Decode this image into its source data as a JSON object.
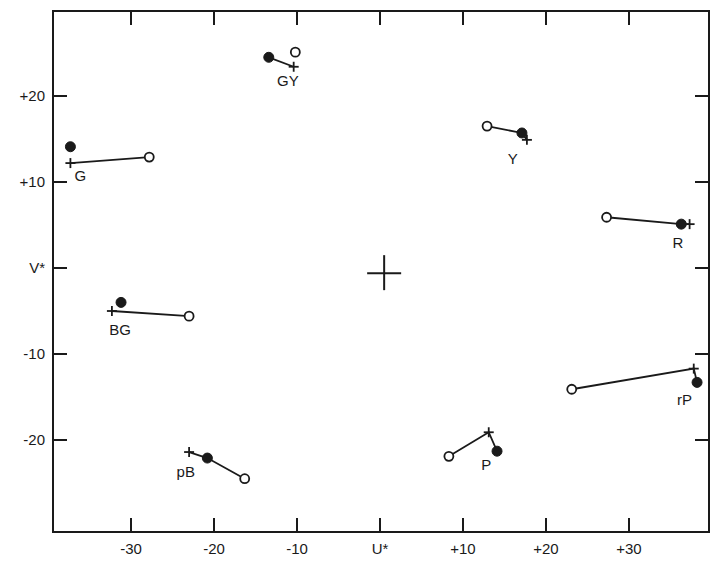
{
  "chart_data": {
    "type": "scatter",
    "title": "",
    "xlabel": "U*",
    "ylabel": "V*",
    "xlim": [
      -39.4,
      39.6
    ],
    "ylim": [
      -30.7,
      29.9
    ],
    "grid": false,
    "legend": null,
    "x_ticks": [
      {
        "value": -30,
        "label": "-30"
      },
      {
        "value": -20,
        "label": "-20"
      },
      {
        "value": -10,
        "label": "-10"
      },
      {
        "value": 0,
        "label": "U*"
      },
      {
        "value": 10,
        "label": "+10"
      },
      {
        "value": 20,
        "label": "+20"
      },
      {
        "value": 30,
        "label": "+30"
      }
    ],
    "y_ticks": [
      {
        "value": 20,
        "label": "+20"
      },
      {
        "value": 10,
        "label": "+10"
      },
      {
        "value": 0,
        "label": "V*"
      },
      {
        "value": -10,
        "label": "-10"
      },
      {
        "value": -20,
        "label": "-20"
      }
    ],
    "center_marker": {
      "x": 0.5,
      "y": -0.6,
      "shape": "cross"
    },
    "marker_legend": {
      "filled": "filled circle",
      "open": "open circle",
      "plus": "plus"
    },
    "groups": [
      {
        "name": "GY",
        "filled": [
          -13.4,
          24.5
        ],
        "open": [
          -10.2,
          25.1
        ],
        "plus": [
          -10.4,
          23.4
        ],
        "line": [
          "filled",
          "plus"
        ],
        "label_pos": [
          -11.1,
          21.8
        ]
      },
      {
        "name": "G",
        "filled": [
          -37.3,
          14.1
        ],
        "plus": [
          -37.3,
          12.2
        ],
        "open": [
          -27.8,
          12.9
        ],
        "line": [
          "plus",
          "open"
        ],
        "label_pos": [
          -36.1,
          10.7
        ]
      },
      {
        "name": "Y",
        "open": [
          12.9,
          16.5
        ],
        "filled": [
          17.1,
          15.7
        ],
        "plus": [
          17.7,
          14.9
        ],
        "line": [
          "open",
          "filled",
          "plus"
        ],
        "label_pos": [
          16.0,
          12.7
        ]
      },
      {
        "name": "R",
        "open": [
          27.3,
          5.9
        ],
        "filled": [
          36.3,
          5.1
        ],
        "plus": [
          37.3,
          5.1
        ],
        "line": [
          "open",
          "filled",
          "plus"
        ],
        "label_pos": [
          35.9,
          2.9
        ]
      },
      {
        "name": "BG",
        "filled": [
          -31.2,
          -4.0
        ],
        "plus": [
          -32.3,
          -5.0
        ],
        "open": [
          -23.0,
          -5.6
        ],
        "line": [
          "plus",
          "open"
        ],
        "label_pos": [
          -31.3,
          -7.2
        ]
      },
      {
        "name": "pB",
        "plus": [
          -23.0,
          -21.4
        ],
        "filled": [
          -20.8,
          -22.1
        ],
        "open": [
          -16.3,
          -24.5
        ],
        "line": [
          "plus",
          "filled",
          "open"
        ],
        "label_pos": [
          -23.4,
          -23.7
        ]
      },
      {
        "name": "P",
        "open": [
          8.3,
          -21.9
        ],
        "plus": [
          13.1,
          -19.1
        ],
        "filled": [
          14.1,
          -21.3
        ],
        "line": [
          "open",
          "plus",
          "filled"
        ],
        "label_pos": [
          12.8,
          -22.9
        ]
      },
      {
        "name": "rP",
        "open": [
          23.1,
          -14.1
        ],
        "plus": [
          37.8,
          -11.7
        ],
        "filled": [
          38.2,
          -13.3
        ],
        "line": [
          "open",
          "plus",
          "filled"
        ],
        "label_pos": [
          36.7,
          -15.3
        ]
      }
    ]
  },
  "layout": {
    "frame": {
      "left": 53,
      "top": 11,
      "right": 709,
      "bottom": 532
    },
    "x_origin_px": 380,
    "x_px_per_unit": 8.3,
    "y_origin_px": 268,
    "y_px_per_unit": 8.6
  },
  "colors": {
    "ink": "#1a1a1a",
    "background": "#ffffff"
  }
}
